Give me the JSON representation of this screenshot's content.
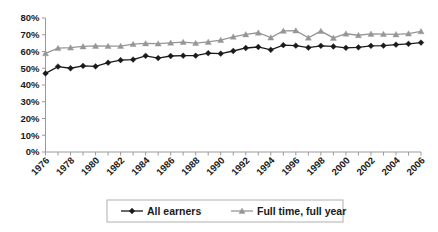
{
  "chart_data": {
    "type": "line",
    "title": "",
    "subtitle": "",
    "xlabel": "",
    "ylabel": "",
    "x": [
      1976,
      1977,
      1978,
      1979,
      1980,
      1981,
      1982,
      1983,
      1984,
      1985,
      1986,
      1987,
      1988,
      1989,
      1990,
      1991,
      1992,
      1993,
      1994,
      1995,
      1996,
      1997,
      1998,
      1999,
      2000,
      2001,
      2002,
      2003,
      2004,
      2005,
      2006
    ],
    "xtick_labels": [
      "1976",
      "1978",
      "1980",
      "1982",
      "1984",
      "1986",
      "1988",
      "1990",
      "1992",
      "1994",
      "1996",
      "1998",
      "2000",
      "2002",
      "2004",
      "2006"
    ],
    "ytick_labels": [
      "0%",
      "10%",
      "20%",
      "30%",
      "40%",
      "50%",
      "60%",
      "70%",
      "80%"
    ],
    "yticks": [
      0,
      10,
      20,
      30,
      40,
      50,
      60,
      70,
      80
    ],
    "ylim": [
      0,
      80
    ],
    "xlim": [
      1976,
      2006
    ],
    "grid": false,
    "legend_position": "bottom",
    "series": [
      {
        "name": "All earners",
        "color": "#1a1a1a",
        "marker": "diamond",
        "values": [
          46.9,
          51.0,
          50.0,
          51.4,
          51.1,
          53.3,
          54.8,
          55.2,
          57.4,
          56.1,
          57.3,
          57.5,
          57.5,
          59.0,
          58.7,
          60.3,
          62.1,
          62.7,
          61.0,
          63.8,
          63.5,
          62.3,
          63.4,
          63.0,
          62.2,
          62.5,
          63.4,
          63.5,
          64.1,
          64.6,
          65.3
        ]
      },
      {
        "name": "Full time, full year",
        "color": "#969696",
        "marker": "triangle",
        "values": [
          58.9,
          62.0,
          62.3,
          63.0,
          63.3,
          63.2,
          63.2,
          64.4,
          64.8,
          64.7,
          65.2,
          65.6,
          65.0,
          65.7,
          66.8,
          68.8,
          70.2,
          71.2,
          68.3,
          72.3,
          72.5,
          68.2,
          72.2,
          68.1,
          70.6,
          69.7,
          70.5,
          70.4,
          70.2,
          70.7,
          72.0
        ]
      }
    ]
  },
  "legend": {
    "items": [
      {
        "label": "All earners",
        "color": "#1a1a1a",
        "marker": "diamond"
      },
      {
        "label": "Full time, full year",
        "color": "#969696",
        "marker": "triangle"
      }
    ]
  }
}
